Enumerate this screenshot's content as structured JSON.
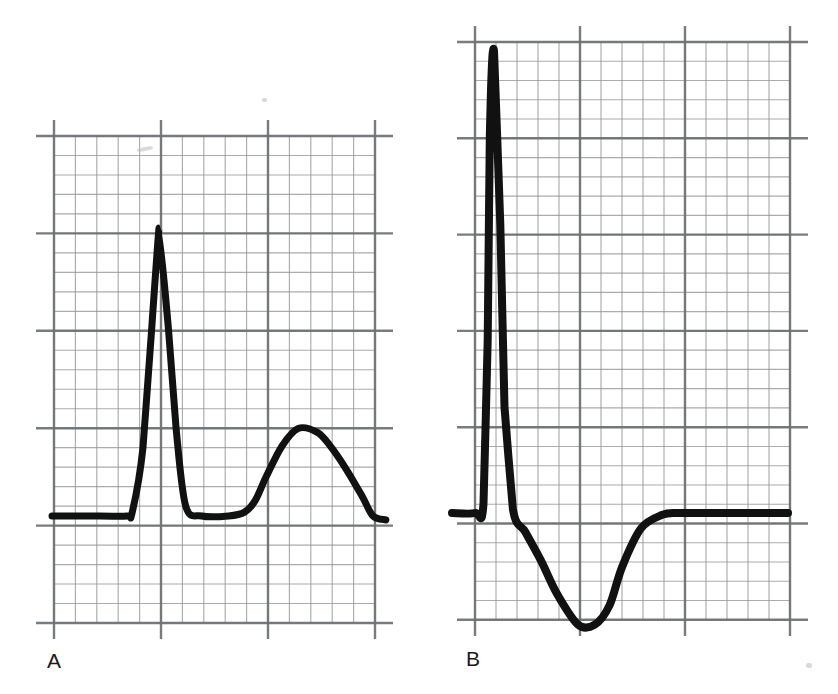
{
  "figure": {
    "background_color": "#ffffff",
    "width": 838,
    "height": 694,
    "grid_color_minor": "#8f9194",
    "grid_color_major": "#6e7174",
    "trace_color": "#111111"
  },
  "panels": [
    {
      "id": "A",
      "label": "A",
      "label_position": {
        "x": 47,
        "y": 650
      },
      "grid": {
        "x_left": 54,
        "x_right": 375,
        "y_top": 136,
        "y_bottom": 623,
        "major_cell_w": 107,
        "major_cell_h": 97.4,
        "minor_per_major": 5,
        "major_cols": 3,
        "major_rows": 5
      },
      "baseline_y": 516,
      "trace_width": 7,
      "features": [
        {
          "name": "isoelectric-baseline-start",
          "x": 52,
          "y": 516
        },
        {
          "name": "r-wave-upstroke-foot",
          "x": 134,
          "y": 512
        },
        {
          "name": "r-wave-peak",
          "x": 162,
          "y": 228
        },
        {
          "name": "r-wave-downstroke-foot",
          "x": 196,
          "y": 512
        },
        {
          "name": "st-segment",
          "x": 230,
          "y": 515
        },
        {
          "name": "t-wave-onset",
          "x": 256,
          "y": 512
        },
        {
          "name": "t-wave-apex",
          "x": 320,
          "y": 427
        },
        {
          "name": "trace-end",
          "x": 388,
          "y": 518
        }
      ]
    },
    {
      "id": "B",
      "label": "B",
      "label_position": {
        "x": 466,
        "y": 648
      },
      "grid": {
        "x_left": 475,
        "x_right": 790,
        "y_top": 42,
        "y_bottom": 620,
        "major_cell_w": 105,
        "major_cell_h": 96.3,
        "minor_per_major": 5,
        "major_cols": 3,
        "major_rows": 6
      },
      "baseline_y": 513,
      "trace_width": 8,
      "features": [
        {
          "name": "isoelectric-baseline-start",
          "x": 452,
          "y": 513
        },
        {
          "name": "r-wave-upstroke-foot",
          "x": 483,
          "y": 508
        },
        {
          "name": "r-wave-peak",
          "x": 512,
          "y": 51
        },
        {
          "name": "r-wave-downstroke-foot",
          "x": 527,
          "y": 511
        },
        {
          "name": "s-wave-descent",
          "x": 560,
          "y": 545
        },
        {
          "name": "s-wave-nadir",
          "x": 618,
          "y": 627
        },
        {
          "name": "s-wave-return",
          "x": 690,
          "y": 512
        },
        {
          "name": "trace-end",
          "x": 792,
          "y": 511
        }
      ]
    }
  ],
  "chart_data": {
    "type": "line",
    "subtitle": "Two ECG complexes plotted on standard ECG graph paper",
    "xlabel": "",
    "ylabel": "",
    "legend": [],
    "grid": true,
    "series": [
      {
        "name": "A",
        "panel_label": "A",
        "description": "Tall narrow upright R wave followed by a broad positive T wave that returns toward and slightly below baseline",
        "x_unit": "large squares (0.20 s each)",
        "y_unit": "mV",
        "x": [
          0.0,
          0.45,
          0.7,
          0.75,
          0.85,
          0.93,
          1.0,
          1.09,
          1.16,
          1.25,
          1.4,
          1.65,
          1.8,
          1.9,
          2.0,
          2.15,
          2.3,
          2.48,
          2.6,
          2.75,
          2.9,
          3.0,
          3.12
        ],
        "y": [
          0.0,
          0.0,
          0.0,
          0.02,
          0.35,
          0.95,
          1.48,
          0.95,
          0.45,
          0.05,
          0.0,
          0.0,
          0.02,
          0.08,
          0.2,
          0.36,
          0.45,
          0.43,
          0.36,
          0.24,
          0.1,
          0.0,
          -0.02
        ],
        "key_points": [
          {
            "label": "baseline",
            "x": 0.0,
            "y": 0.0
          },
          {
            "label": "R wave peak",
            "x": 1.0,
            "y": 1.48
          },
          {
            "label": "T wave apex",
            "x": 2.48,
            "y": 0.45
          },
          {
            "label": "trace end",
            "x": 3.12,
            "y": -0.02
          }
        ]
      },
      {
        "name": "B",
        "panel_label": "B",
        "description": "Very tall narrow R wave followed by a deep broad negative S / ST depression trough returning to baseline",
        "x_unit": "large squares (0.20 s each)",
        "y_unit": "mV",
        "x": [
          0.0,
          0.22,
          0.3,
          0.34,
          0.36,
          0.4,
          0.46,
          0.5,
          0.58,
          0.7,
          0.85,
          1.0,
          1.2,
          1.36,
          1.5,
          1.62,
          1.8,
          2.0,
          2.15,
          2.4,
          2.7,
          3.0,
          3.2
        ],
        "y": [
          0.0,
          0.0,
          0.05,
          0.9,
          1.95,
          2.4,
          1.5,
          0.55,
          0.02,
          -0.1,
          -0.25,
          -0.42,
          -0.58,
          -0.58,
          -0.48,
          -0.28,
          -0.08,
          -0.01,
          0.0,
          0.0,
          0.0,
          0.0,
          0.0
        ],
        "key_points": [
          {
            "label": "baseline",
            "x": 0.0,
            "y": 0.0
          },
          {
            "label": "R wave peak",
            "x": 0.4,
            "y": 2.4
          },
          {
            "label": "S wave nadir",
            "x": 1.3,
            "y": -0.59
          },
          {
            "label": "return to baseline",
            "x": 2.05,
            "y": 0.0
          }
        ]
      }
    ]
  }
}
